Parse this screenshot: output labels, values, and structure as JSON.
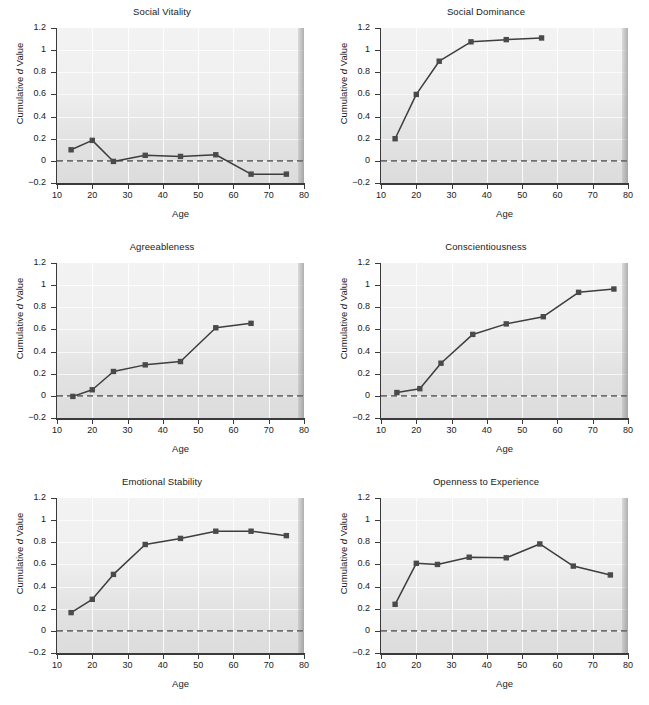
{
  "figure": {
    "panel_count": 6,
    "shared_axes": {
      "xlabel": "Age",
      "ylabel_prefix": "Cumulative ",
      "ylabel_italic": "d",
      "ylabel_suffix": " Value",
      "xlim": [
        10,
        80
      ],
      "ylim": [
        -0.2,
        1.2
      ],
      "xticks": [
        10,
        20,
        30,
        40,
        50,
        60,
        70,
        80
      ],
      "yticks": [
        -0.2,
        0,
        0.2,
        0.4,
        0.6,
        0.8,
        1,
        1.2
      ],
      "ytick_labels": [
        "−0.2",
        "0",
        "0.2",
        "0.4",
        "0.6",
        "0.8",
        "1",
        "1.2"
      ],
      "xtick_labels": [
        "10",
        "20",
        "30",
        "40",
        "50",
        "60",
        "70",
        "80"
      ],
      "grid": true,
      "zero_reference_line": 0,
      "legend": "none"
    },
    "style": {
      "line_color": "#3d3d3d",
      "marker_color": "#4a4a4a",
      "zero_line_color": "#6e6e6e",
      "axis_color": "#3a3a3a",
      "plot_bg_top": "#f3f3f3",
      "plot_bg_bottom": "#dcdcdc",
      "gridline_color": "#ffffff",
      "text_color": "#1a1a1a",
      "marker": "square"
    }
  },
  "chart_data": [
    {
      "type": "line",
      "title": "Social Vitality",
      "xlabel": "Age",
      "ylabel": "Cumulative d Value",
      "xlim": [
        10,
        80
      ],
      "ylim": [
        -0.2,
        1.2
      ],
      "grid": true,
      "legend": "none",
      "x": [
        14,
        20,
        26,
        35,
        45,
        55,
        65,
        75
      ],
      "values": [
        0.1,
        0.185,
        -0.005,
        0.05,
        0.04,
        0.055,
        -0.12,
        -0.12
      ]
    },
    {
      "type": "line",
      "title": "Social Dominance",
      "xlabel": "Age",
      "ylabel": "Cumulative d Value",
      "xlim": [
        10,
        80
      ],
      "ylim": [
        -0.2,
        1.2
      ],
      "grid": true,
      "legend": "none",
      "x": [
        14,
        20,
        26.5,
        35.5,
        45.5,
        55.5
      ],
      "values": [
        0.2,
        0.6,
        0.9,
        1.075,
        1.095,
        1.11
      ]
    },
    {
      "type": "line",
      "title": "Agreeableness",
      "xlabel": "Age",
      "ylabel": "Cumulative d Value",
      "xlim": [
        10,
        80
      ],
      "ylim": [
        -0.2,
        1.2
      ],
      "grid": true,
      "legend": "none",
      "x": [
        14.5,
        20,
        26,
        35,
        45,
        55,
        65
      ],
      "values": [
        -0.005,
        0.055,
        0.22,
        0.28,
        0.31,
        0.615,
        0.655
      ]
    },
    {
      "type": "line",
      "title": "Conscientiousness",
      "xlabel": "Age",
      "ylabel": "Cumulative d Value",
      "xlim": [
        10,
        80
      ],
      "ylim": [
        -0.2,
        1.2
      ],
      "grid": true,
      "legend": "none",
      "x": [
        14.5,
        21,
        27,
        36,
        45.5,
        56,
        66,
        76
      ],
      "values": [
        0.03,
        0.065,
        0.295,
        0.555,
        0.65,
        0.715,
        0.935,
        0.965
      ]
    },
    {
      "type": "line",
      "title": "Emotional Stability",
      "xlabel": "Age",
      "ylabel": "Cumulative d Value",
      "xlim": [
        10,
        80
      ],
      "ylim": [
        -0.2,
        1.2
      ],
      "grid": true,
      "legend": "none",
      "x": [
        14,
        20,
        26,
        35,
        45,
        55,
        65,
        75
      ],
      "values": [
        0.165,
        0.285,
        0.51,
        0.78,
        0.835,
        0.9,
        0.9,
        0.86
      ]
    },
    {
      "type": "line",
      "title": "Openness to Experience",
      "xlabel": "Age",
      "ylabel": "Cumulative d Value",
      "xlim": [
        10,
        80
      ],
      "ylim": [
        -0.2,
        1.2
      ],
      "grid": true,
      "legend": "none",
      "x": [
        14,
        20,
        26,
        35,
        45.5,
        55,
        64.5,
        75
      ],
      "values": [
        0.24,
        0.61,
        0.6,
        0.665,
        0.66,
        0.785,
        0.585,
        0.505
      ]
    }
  ]
}
